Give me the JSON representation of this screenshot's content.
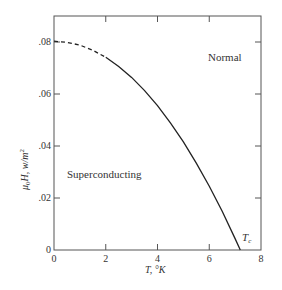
{
  "chart_data": {
    "type": "line",
    "title": "",
    "xlabel": "T, °K",
    "ylabel": "μ0H, w/m²",
    "xlim": [
      0,
      8
    ],
    "ylim": [
      0,
      0.09
    ],
    "x_ticks": [
      0,
      2,
      4,
      6,
      8
    ],
    "x_tick_labels": [
      "0",
      "2",
      "4",
      "6",
      "8"
    ],
    "y_ticks": [
      0,
      0.02,
      0.04,
      0.06,
      0.08
    ],
    "y_tick_labels": [
      "0",
      ".02",
      ".04",
      ".06",
      ".08"
    ],
    "grid": false,
    "series": [
      {
        "name": "critical field curve",
        "style": "dashed for T<2, solid for T>=2",
        "x": [
          0,
          0.5,
          1,
          1.5,
          2,
          2.5,
          3,
          3.5,
          4,
          4.5,
          5,
          5.5,
          6,
          6.5,
          7,
          7.2
        ],
        "values": [
          0.0803,
          0.0799,
          0.0788,
          0.0768,
          0.0741,
          0.0706,
          0.0664,
          0.0613,
          0.0555,
          0.0489,
          0.0416,
          0.0334,
          0.0245,
          0.0149,
          0.0044,
          0.0
        ]
      }
    ],
    "annotations": [
      {
        "text": "Normal",
        "x": 6.0,
        "y": 0.081
      },
      {
        "text": "Superconducting",
        "x": 2.0,
        "y": 0.0285
      },
      {
        "text": "Tc",
        "x": 7.25,
        "y": 0.004
      }
    ]
  },
  "labels": {
    "region_normal": "Normal",
    "region_superconducting": "Superconducting",
    "tc": "T",
    "tc_sub": "c",
    "xlabel": "T, °K",
    "ylabel_main": "μ",
    "ylabel_sub": "0",
    "ylabel_rest": "H,  w/m",
    "ylabel_sup": "2"
  }
}
